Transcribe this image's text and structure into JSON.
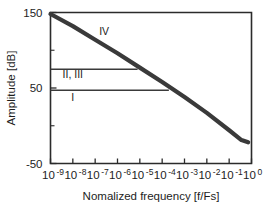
{
  "chart_data": {
    "type": "line",
    "title": "",
    "xlabel": "Nomalized frequency [f/Fs]",
    "ylabel": "Amplitude [dB]",
    "xscale": "log10",
    "xlim": [
      -9,
      0
    ],
    "ylim": [
      -50,
      150
    ],
    "yticks": [
      150,
      50,
      -50
    ],
    "ytick_labels": [
      "150",
      "50",
      "-50"
    ],
    "yticks_minor": [
      100,
      0
    ],
    "xticks": [
      -9,
      -8,
      -7,
      -6,
      -5,
      -4,
      -3,
      -2,
      -1,
      0
    ],
    "xtick_labels": [
      {
        "mantissa": "10",
        "exponent": "-9"
      },
      {
        "mantissa": "10",
        "exponent": "-8"
      },
      {
        "mantissa": "10",
        "exponent": "-7"
      },
      {
        "mantissa": "10",
        "exponent": "-6"
      },
      {
        "mantissa": "10",
        "exponent": "-5"
      },
      {
        "mantissa": "10",
        "exponent": "-4"
      },
      {
        "mantissa": "10",
        "exponent": "-3"
      },
      {
        "mantissa": "10",
        "exponent": "-2"
      },
      {
        "mantissa": "10",
        "exponent": "-1"
      },
      {
        "mantissa": "10",
        "exponent": "0"
      }
    ],
    "grid": false,
    "legend": "none",
    "series": [
      {
        "name": "IV",
        "style": "thick",
        "points": [
          {
            "x": -9.0,
            "y": 148
          },
          {
            "x": -8.0,
            "y": 132
          },
          {
            "x": -7.0,
            "y": 114
          },
          {
            "x": -6.0,
            "y": 96
          },
          {
            "x": -5.0,
            "y": 77
          },
          {
            "x": -4.0,
            "y": 58
          },
          {
            "x": -3.0,
            "y": 38
          },
          {
            "x": -2.0,
            "y": 17
          },
          {
            "x": -1.0,
            "y": -6
          },
          {
            "x": -0.45,
            "y": -19
          },
          {
            "x": -0.15,
            "y": -22
          }
        ]
      },
      {
        "name": "II, III",
        "style": "thin",
        "points": [
          {
            "x": -9.0,
            "y": 75
          },
          {
            "x": -5.1,
            "y": 75
          }
        ]
      },
      {
        "name": "I",
        "style": "thin",
        "points": [
          {
            "x": -9.0,
            "y": 47
          },
          {
            "x": -3.7,
            "y": 47
          }
        ]
      }
    ],
    "annotations": [
      {
        "text": "IV",
        "x": -6.6,
        "y": 120
      },
      {
        "text": "II, III",
        "x": -8.0,
        "y": 63
      },
      {
        "text": "I",
        "x": -8.0,
        "y": 33
      }
    ]
  },
  "colors": {
    "curve": "#3a3a3a",
    "axis": "#2b2b2b",
    "text": "#1d1d1d",
    "background": "#ffffff"
  }
}
